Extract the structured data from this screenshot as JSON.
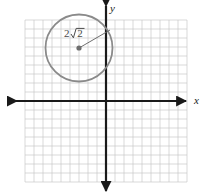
{
  "figure": {
    "background_color": "#ffffff"
  },
  "grid": {
    "color": "#c9c9c9",
    "cell_size": 9,
    "left": 25,
    "top": 20,
    "right": 187,
    "bottom": 182,
    "columns": 18,
    "rows": 18
  },
  "axes": {
    "color": "#1a1a1a",
    "origin_x": 106,
    "origin_y": 101,
    "x_label": "x",
    "y_label": "y",
    "x_label_pos": {
      "x": 194,
      "y": 104
    },
    "y_label_pos": {
      "x": 110,
      "y": 12
    },
    "x_axis_start": 8,
    "x_axis_end": 186,
    "y_axis_start": 6,
    "y_axis_end": 191
  },
  "circle": {
    "color": "#8a8a8a",
    "center_px": {
      "x": 79,
      "y": 48
    },
    "radius_px": 33.5,
    "center_units": {
      "x": -3,
      "y": 6
    },
    "radius_units": 3.7,
    "stroke_width": 1.8
  },
  "radius_segment": {
    "color": "#6e6e6e",
    "from": {
      "x": 79,
      "y": 48
    },
    "to": {
      "x": 110,
      "y": 30
    },
    "label": "2√2",
    "label_coefficient": "2",
    "label_radicand": "2",
    "label_pos": {
      "x": 64,
      "y": 37
    }
  },
  "center_dot": {
    "color": "#6e6e6e",
    "radius_px": 2.6
  },
  "chart_data": {
    "type": "scatter",
    "title": "",
    "xlabel": "x",
    "ylabel": "y",
    "grid": true,
    "legend": false,
    "xlim": [
      -9,
      9
    ],
    "ylim": [
      -9,
      9
    ],
    "annotations": [
      {
        "text": "2√2",
        "kind": "radius-length",
        "x": -4.5,
        "y": 7.0
      }
    ],
    "shapes": [
      {
        "type": "circle",
        "center": [
          -3,
          6
        ],
        "radius": 3.7,
        "stroke": "#8a8a8a",
        "fill": "none"
      },
      {
        "type": "segment",
        "from": [
          -3,
          6
        ],
        "to": [
          0.4,
          8
        ],
        "stroke": "#6e6e6e",
        "label": "2√2"
      },
      {
        "type": "point",
        "at": [
          -3,
          6
        ],
        "fill": "#6e6e6e",
        "role": "circle-center"
      }
    ]
  }
}
